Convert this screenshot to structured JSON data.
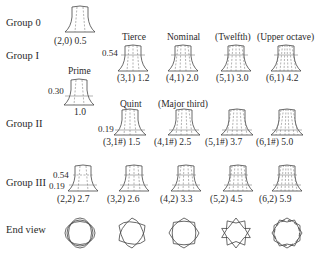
{
  "groups": [
    {
      "label": "Group 0"
    },
    {
      "label": "Group I"
    },
    {
      "label": "Group II"
    },
    {
      "label": "Group III"
    },
    {
      "label": "End view"
    }
  ],
  "modes": {
    "g0": {
      "mode": "(2,0)",
      "freq": "0.5"
    },
    "prime": {
      "name": "Prime",
      "mode": "",
      "freq": "1.0",
      "height_ratio": "0.30"
    },
    "tierce": {
      "name": "Tierce",
      "mode": "(3,1)",
      "freq": "1.2",
      "height_ratio": "0.54"
    },
    "nominal": {
      "name": "Nominal",
      "mode": "(4,1)",
      "freq": "2.0"
    },
    "twelfth": {
      "name": "(Twelfth)",
      "mode": "(5,1)",
      "freq": "3.0"
    },
    "upper_octave": {
      "name": "(Upper octave)",
      "mode": "(6,1)",
      "freq": "4.2"
    },
    "quint": {
      "name": "Quint",
      "mode": "(3,1#)",
      "freq": "1.5",
      "height_ratio": "0.19"
    },
    "major_third": {
      "name": "(Major third)",
      "mode": "(4,1#)",
      "freq": "2.5"
    },
    "g2_5": {
      "mode": "(5,1#)",
      "freq": "3.7"
    },
    "g2_6": {
      "mode": "(6,1#)",
      "freq": "5.0"
    },
    "g3_2": {
      "mode": "(2,2)",
      "freq": "2.7",
      "height_ratio_top": "0.54",
      "height_ratio_bottom": "0.19"
    },
    "g3_3": {
      "mode": "(3,2)",
      "freq": "2.6"
    },
    "g3_4": {
      "mode": "(4,2)",
      "freq": "3.3"
    },
    "g3_5": {
      "mode": "(5,2)",
      "freq": "4.5"
    },
    "g3_6": {
      "mode": "(6,2)",
      "freq": "5.9"
    }
  },
  "labels": {
    "g0": "(2,0) 0.5",
    "tierce": "(3,1) 1.2",
    "nominal": "(4,1) 2.0",
    "twelfth": "(5,1) 3.0",
    "upper_octave": "(6,1) 4.2",
    "prime": "1.0",
    "quint": "(3,1#) 1.5",
    "major_third": "(4,1#) 2.5",
    "g2_5": "(5,1#) 3.7",
    "g2_6": "(6,1#) 5.0",
    "g3_2": "(2,2) 2.7",
    "g3_3": "(3,2) 2.6",
    "g3_4": "(4,2) 3.3",
    "g3_5": "(5,2) 4.5",
    "g3_6": "(6,2) 5.9"
  },
  "end_view": {
    "lobes": [
      2,
      3,
      4,
      5,
      6
    ]
  }
}
